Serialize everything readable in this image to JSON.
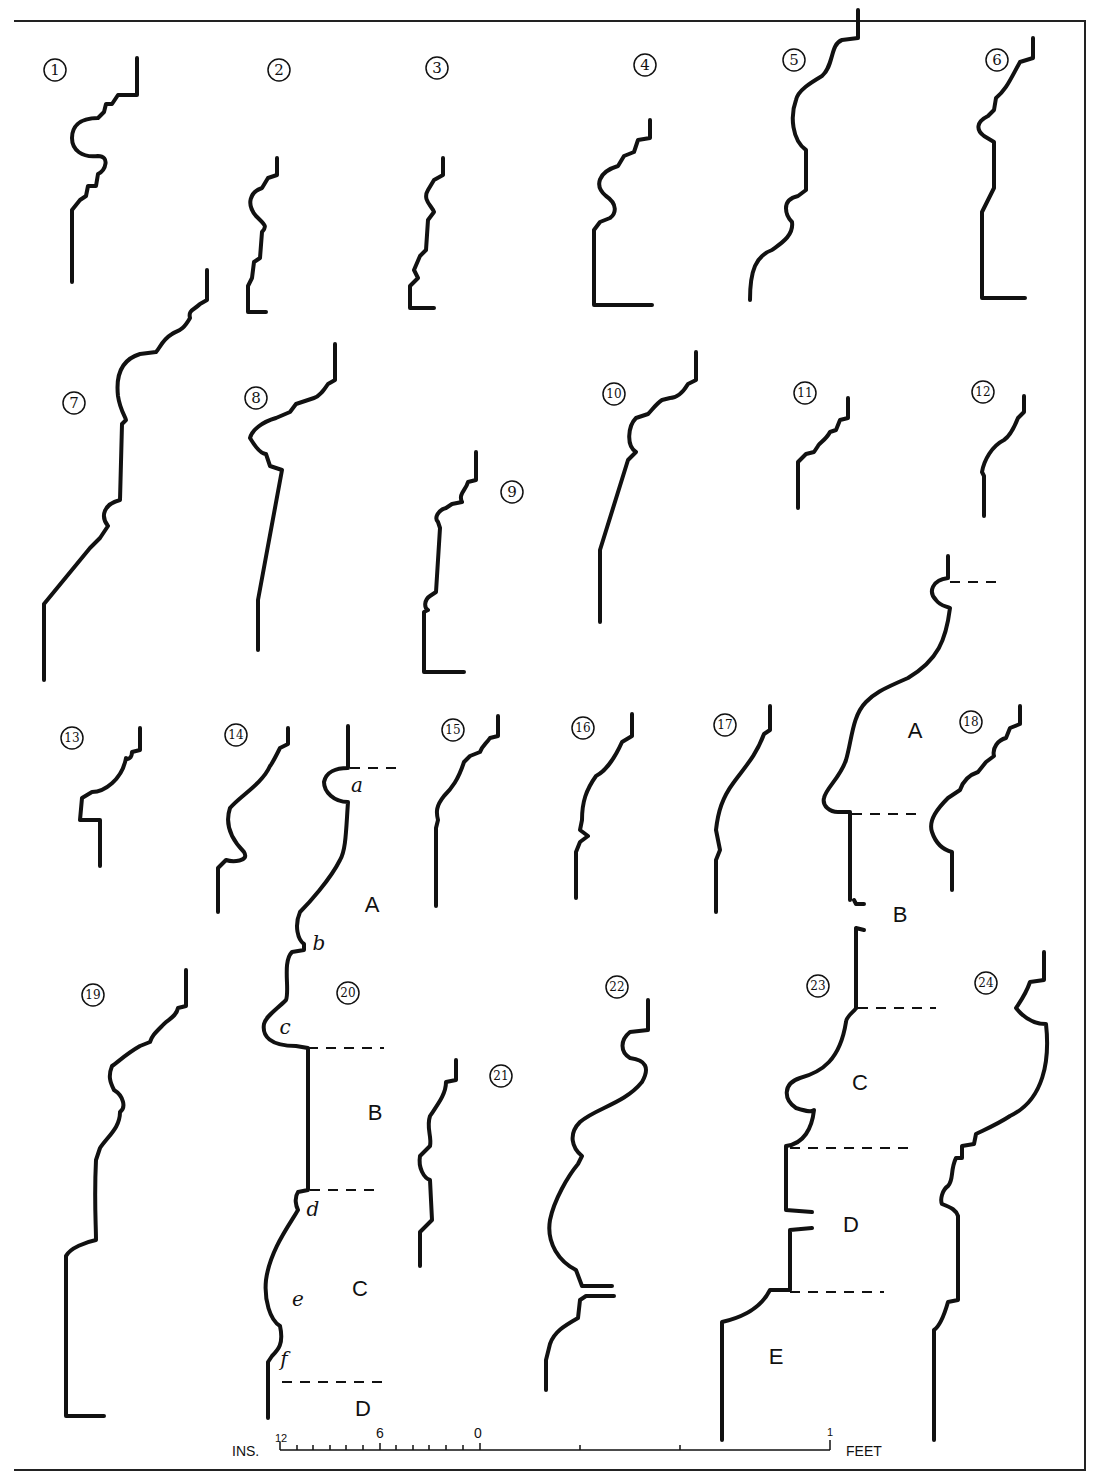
{
  "plate": {
    "profile_numbers": [
      "1",
      "2",
      "3",
      "4",
      "5",
      "6",
      "7",
      "8",
      "9",
      "10",
      "11",
      "12",
      "13",
      "14",
      "15",
      "16",
      "17",
      "18",
      "19",
      "20",
      "21",
      "22",
      "23",
      "24"
    ],
    "profile_20_letters": {
      "a": "a",
      "b": "b",
      "c": "c",
      "d": "d",
      "e": "e",
      "f": "f"
    },
    "profile_20_sections": {
      "A": "A",
      "B": "B",
      "C": "C",
      "D": "D"
    },
    "profile_23_sections": {
      "A": "A",
      "B": "B",
      "C": "C",
      "D": "D",
      "E": "E"
    }
  },
  "scale": {
    "left_unit": "INS.",
    "right_unit": "FEET",
    "ticks": {
      "t12": "12",
      "t6": "6",
      "t0": "0",
      "t1": "1"
    }
  },
  "colors": {
    "ink": "#111111",
    "paper": "#ffffff"
  }
}
